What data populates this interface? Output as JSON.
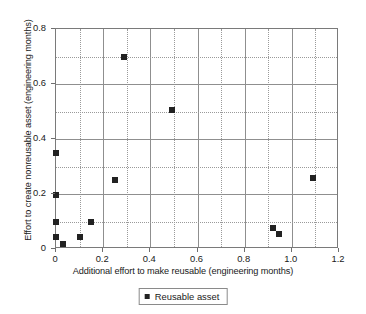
{
  "chart_data": {
    "type": "scatter",
    "title": "",
    "xlabel": "Additional effort to make reusable (engineering months)",
    "ylabel": "Effort to create nonreusable asset (engineering months)",
    "xlim": [
      0,
      1.2
    ],
    "ylim": [
      0,
      0.8
    ],
    "x_major_ticks": [
      0,
      0.2,
      0.4,
      0.6,
      0.8,
      1.0,
      1.2
    ],
    "x_tick_labels": [
      "0",
      "0.2",
      "0.4",
      "0.6",
      "0.8",
      "1.0",
      "1.2"
    ],
    "y_major_ticks": [
      0,
      0.2,
      0.4,
      0.6,
      0.8
    ],
    "y_tick_labels": [
      "0",
      "0.2",
      "0.4",
      "0.6",
      "0.8"
    ],
    "x_minor_gridlines": [
      0.1,
      0.3,
      0.5,
      0.7,
      0.9,
      1.1
    ],
    "y_minor_gridlines": [
      0.1,
      0.3,
      0.5,
      0.7
    ],
    "grid": true,
    "legend_position": "bottom-center",
    "series": [
      {
        "name": "Reusable asset",
        "marker": "square",
        "color": "#222222",
        "points": [
          {
            "x": 0.0,
            "y": 0.35
          },
          {
            "x": 0.0,
            "y": 0.195
          },
          {
            "x": 0.0,
            "y": 0.1
          },
          {
            "x": 0.0,
            "y": 0.045
          },
          {
            "x": 0.03,
            "y": 0.02
          },
          {
            "x": 0.1,
            "y": 0.045
          },
          {
            "x": 0.15,
            "y": 0.1
          },
          {
            "x": 0.25,
            "y": 0.25
          },
          {
            "x": 0.29,
            "y": 0.7
          },
          {
            "x": 0.49,
            "y": 0.505
          },
          {
            "x": 0.92,
            "y": 0.075
          },
          {
            "x": 0.945,
            "y": 0.055
          },
          {
            "x": 1.09,
            "y": 0.26
          }
        ]
      }
    ]
  },
  "legend": {
    "label": "Reusable asset"
  },
  "colors": {
    "marker": "#222222",
    "grid_major": "#8f8f8f",
    "grid_minor": "#9a9a9a",
    "frame": "#7a7a7a",
    "text": "#1a1a1a",
    "background": "#ffffff"
  }
}
